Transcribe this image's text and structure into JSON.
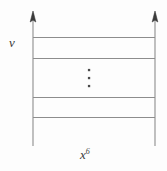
{
  "figure": {
    "type": "diagram",
    "background_color": "#fdfdfd",
    "stroke_color": "#8d8d8d",
    "arrow_color": "#3a3a3a",
    "text_color": "#3b3b3b",
    "labels": {
      "left_axis": "v",
      "bottom_axis_base": "x",
      "bottom_axis_exponent": "6"
    },
    "vertical_lines": [
      {
        "name": "left-vertical-line",
        "x": 33,
        "y_top": 12,
        "y_bottom": 146,
        "arrow": "up"
      },
      {
        "name": "right-vertical-line",
        "x": 155,
        "y_top": 12,
        "y_bottom": 146,
        "arrow": "up"
      }
    ],
    "horizontal_lines": [
      {
        "name": "horizontal-line-1",
        "y": 37,
        "x_start": 33,
        "x_end": 155
      },
      {
        "name": "horizontal-line-2",
        "y": 58,
        "x_start": 33,
        "x_end": 155
      },
      {
        "name": "horizontal-line-3",
        "y": 97,
        "x_start": 33,
        "x_end": 155
      },
      {
        "name": "horizontal-line-4",
        "y": 117,
        "x_start": 33,
        "x_end": 155
      }
    ],
    "ellipsis": {
      "name": "vertical-ellipsis",
      "x": 89,
      "dots_y": [
        70,
        78,
        86
      ],
      "dot_size": 2.2,
      "count": 3
    }
  }
}
